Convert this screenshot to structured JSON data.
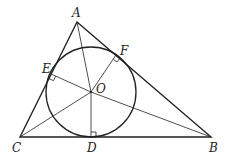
{
  "diagram": {
    "points": {
      "A": {
        "label": "A",
        "x": 77,
        "y": 22
      },
      "B": {
        "label": "B",
        "x": 211,
        "y": 137
      },
      "C": {
        "label": "C",
        "x": 20,
        "y": 137
      },
      "O": {
        "label": "O",
        "x": 91,
        "y": 92
      },
      "D": {
        "label": "D",
        "x": 91,
        "y": 137
      },
      "E": {
        "label": "E",
        "x": 51,
        "y": 74
      },
      "F": {
        "label": "F",
        "x": 116,
        "y": 55
      }
    },
    "circle": {
      "center": "O",
      "radius": 45
    },
    "segments": [
      "AB",
      "BC",
      "CA",
      "OA",
      "OB",
      "OC",
      "OD",
      "OE",
      "OF"
    ],
    "right_angles": [
      "D",
      "E",
      "F"
    ],
    "colors": {
      "stroke": "#222222",
      "background": "#ffffff"
    }
  }
}
